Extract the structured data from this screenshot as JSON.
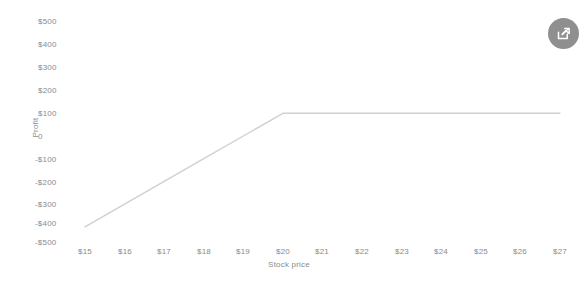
{
  "chart_data": {
    "type": "line",
    "title": "",
    "xlabel": "Stock price",
    "ylabel": "Profit",
    "xlim": [
      15,
      27
    ],
    "ylim": [
      -500,
      500
    ],
    "grid": false,
    "legend": false,
    "x_tick_labels": [
      "$15",
      "$16",
      "$17",
      "$18",
      "$19",
      "$20",
      "$21",
      "$22",
      "$23",
      "$24",
      "$25",
      "$26",
      "$27"
    ],
    "x_tick_values": [
      15,
      16,
      17,
      18,
      19,
      20,
      21,
      22,
      23,
      24,
      25,
      26,
      27
    ],
    "y_tick_labels": [
      "$500",
      "$400",
      "$300",
      "$200",
      "$100",
      "0",
      "-$100",
      "-$200",
      "-$300",
      "-$400",
      "-$500"
    ],
    "y_tick_values": [
      500,
      400,
      300,
      200,
      100,
      0,
      -100,
      -200,
      -300,
      -400,
      -500
    ],
    "series": [
      {
        "name": "Profit",
        "color": "#d0d0d0",
        "x": [
          15,
          16,
          17,
          18,
          19,
          20,
          21,
          22,
          23,
          24,
          25,
          26,
          27
        ],
        "values": [
          -400,
          -300,
          -200,
          -100,
          0,
          100,
          100,
          100,
          100,
          100,
          100,
          100,
          100
        ]
      }
    ],
    "annotations": []
  },
  "axis": {
    "y_title": "Profit",
    "x_title": "Stock price"
  },
  "colors": {
    "line": "#d0d0d0",
    "tick_text": "#8a8a8a",
    "background": "#ffffff",
    "fab_background": "#8f8f8f",
    "fab_icon": "#ffffff"
  },
  "toolbar": {
    "share_label": "Share"
  }
}
